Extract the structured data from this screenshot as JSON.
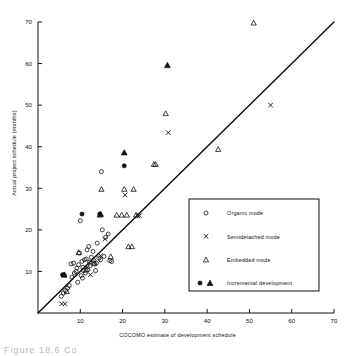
{
  "figure": {
    "caption": "Figure  18.6   Co",
    "background": "#ffffff",
    "ink_color": "#111111"
  },
  "chart_data": {
    "type": "scatter",
    "title": "",
    "xlabel": "COCOMO estimate of development schedule",
    "ylabel": "Actual project schedule (months)",
    "xlim": [
      0,
      70
    ],
    "ylim": [
      0,
      70
    ],
    "xticks": [
      10,
      20,
      30,
      40,
      50,
      60,
      70
    ],
    "yticks": [
      10,
      20,
      30,
      40,
      50,
      60,
      70
    ],
    "grid": false,
    "legend_position": "lower-right-inside",
    "reference_line": {
      "name": "identity-line",
      "description": "y = x",
      "from": [
        0,
        0
      ],
      "to": [
        70,
        70
      ]
    },
    "series": [
      {
        "name": "Organic mode",
        "marker": "open-circle",
        "points": [
          [
            5.5,
            4.0
          ],
          [
            6.0,
            4.8
          ],
          [
            6.5,
            5.4
          ],
          [
            7.0,
            6.0
          ],
          [
            6.2,
            9.2
          ],
          [
            7.8,
            11.8
          ],
          [
            8.4,
            12.0
          ],
          [
            8.0,
            8.6
          ],
          [
            8.6,
            9.6
          ],
          [
            9.0,
            10.0
          ],
          [
            9.2,
            10.8
          ],
          [
            9.6,
            11.6
          ],
          [
            9.8,
            14.4
          ],
          [
            10.0,
            22.2
          ],
          [
            10.2,
            9.0
          ],
          [
            10.4,
            12.4
          ],
          [
            10.6,
            11.0
          ],
          [
            10.8,
            10.2
          ],
          [
            11.0,
            12.8
          ],
          [
            11.2,
            9.6
          ],
          [
            11.4,
            13.0
          ],
          [
            11.8,
            10.4
          ],
          [
            12.0,
            16.0
          ],
          [
            12.2,
            12.2
          ],
          [
            12.4,
            11.4
          ],
          [
            12.6,
            13.4
          ],
          [
            13.0,
            14.8
          ],
          [
            13.2,
            12.6
          ],
          [
            13.4,
            11.8
          ],
          [
            13.8,
            12.0
          ],
          [
            14.0,
            16.8
          ],
          [
            14.4,
            13.2
          ],
          [
            14.8,
            12.8
          ],
          [
            15.2,
            20.0
          ],
          [
            15.6,
            13.6
          ],
          [
            16.0,
            18.2
          ],
          [
            16.6,
            19.0
          ],
          [
            17.0,
            12.6
          ],
          [
            15.0,
            34.0
          ],
          [
            17.4,
            12.4
          ],
          [
            11.6,
            15.2
          ],
          [
            10.5,
            8.4
          ],
          [
            9.4,
            7.4
          ],
          [
            7.4,
            6.6
          ],
          [
            13.6,
            10.2
          ]
        ]
      },
      {
        "name": "Semidetached mode",
        "marker": "cross",
        "points": [
          [
            5.6,
            2.2
          ],
          [
            6.4,
            2.2
          ],
          [
            14.8,
            13.8
          ],
          [
            15.8,
            17.8
          ],
          [
            20.6,
            28.4
          ],
          [
            23.6,
            23.4
          ],
          [
            24.0,
            23.4
          ],
          [
            30.8,
            43.4
          ],
          [
            55.0,
            50.0
          ],
          [
            11.6,
            11.0
          ],
          [
            12.4,
            9.2
          ]
        ]
      },
      {
        "name": "Embedded mode",
        "marker": "open-triangle",
        "points": [
          [
            6.8,
            5.2
          ],
          [
            9.6,
            14.6
          ],
          [
            11.4,
            10.4
          ],
          [
            14.6,
            23.6
          ],
          [
            15.0,
            29.8
          ],
          [
            17.2,
            13.6
          ],
          [
            19.8,
            23.6
          ],
          [
            21.4,
            16.0
          ],
          [
            22.2,
            16.0
          ],
          [
            20.4,
            29.8
          ],
          [
            22.6,
            29.8
          ],
          [
            23.2,
            23.6
          ],
          [
            27.4,
            35.8
          ],
          [
            27.8,
            35.8
          ],
          [
            30.2,
            48.0
          ],
          [
            42.6,
            39.4
          ],
          [
            51.0,
            69.8
          ],
          [
            21.0,
            23.6
          ],
          [
            18.6,
            23.6
          ],
          [
            13.2,
            12.0
          ]
        ]
      },
      {
        "name": "Incremental development",
        "marker": "filled",
        "points": [
          [
            5.8,
            9.2,
            "circle"
          ],
          [
            10.4,
            23.8,
            "circle"
          ],
          [
            14.6,
            23.8,
            "circle"
          ],
          [
            20.4,
            35.4,
            "circle"
          ],
          [
            20.4,
            38.6,
            "triangle"
          ],
          [
            14.8,
            23.8,
            "triangle"
          ],
          [
            30.6,
            59.6,
            "triangle"
          ],
          [
            6.2,
            9.2,
            "triangle"
          ]
        ]
      }
    ],
    "legend": [
      {
        "label": "Organic mode",
        "marker": "open-circle"
      },
      {
        "label": "Semidetached mode",
        "marker": "cross"
      },
      {
        "label": "Embedded mode",
        "marker": "open-triangle"
      },
      {
        "label": "Incremental development",
        "marker": "filled-pair"
      }
    ]
  }
}
